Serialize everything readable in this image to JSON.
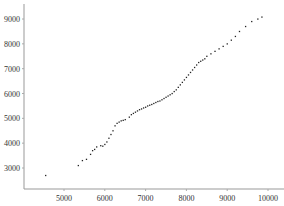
{
  "chart_data": {
    "type": "scatter",
    "title": "",
    "xlabel": "",
    "ylabel": "",
    "xlim": [
      4000,
      10500
    ],
    "ylim": [
      2000,
      9700
    ],
    "xticks": [
      5000,
      6000,
      7000,
      8000,
      9000,
      10000
    ],
    "yticks": [
      3000,
      4000,
      5000,
      6000,
      7000,
      8000,
      9000
    ],
    "grid": false,
    "legend": null,
    "marker_color": "#222222",
    "points": [
      [
        4550,
        2700
      ],
      [
        5350,
        3100
      ],
      [
        5450,
        3300
      ],
      [
        5550,
        3350
      ],
      [
        5650,
        3550
      ],
      [
        5700,
        3700
      ],
      [
        5750,
        3750
      ],
      [
        5800,
        3850
      ],
      [
        5900,
        3900
      ],
      [
        5950,
        3880
      ],
      [
        6000,
        3950
      ],
      [
        6050,
        4050
      ],
      [
        6100,
        4200
      ],
      [
        6150,
        4350
      ],
      [
        6200,
        4500
      ],
      [
        6250,
        4700
      ],
      [
        6300,
        4800
      ],
      [
        6350,
        4850
      ],
      [
        6400,
        4900
      ],
      [
        6450,
        4920
      ],
      [
        6500,
        4950
      ],
      [
        6600,
        5050
      ],
      [
        6650,
        5150
      ],
      [
        6700,
        5200
      ],
      [
        6750,
        5250
      ],
      [
        6800,
        5300
      ],
      [
        6850,
        5350
      ],
      [
        6900,
        5380
      ],
      [
        6950,
        5420
      ],
      [
        7000,
        5450
      ],
      [
        7050,
        5500
      ],
      [
        7100,
        5530
      ],
      [
        7150,
        5560
      ],
      [
        7200,
        5600
      ],
      [
        7250,
        5640
      ],
      [
        7300,
        5680
      ],
      [
        7350,
        5700
      ],
      [
        7400,
        5750
      ],
      [
        7450,
        5800
      ],
      [
        7500,
        5850
      ],
      [
        7550,
        5900
      ],
      [
        7600,
        5950
      ],
      [
        7650,
        6000
      ],
      [
        7700,
        6080
      ],
      [
        7750,
        6150
      ],
      [
        7800,
        6250
      ],
      [
        7850,
        6350
      ],
      [
        7900,
        6450
      ],
      [
        7950,
        6550
      ],
      [
        8000,
        6650
      ],
      [
        8050,
        6750
      ],
      [
        8100,
        6850
      ],
      [
        8150,
        6950
      ],
      [
        8200,
        7050
      ],
      [
        8250,
        7150
      ],
      [
        8300,
        7250
      ],
      [
        8350,
        7300
      ],
      [
        8400,
        7350
      ],
      [
        8450,
        7400
      ],
      [
        8500,
        7500
      ],
      [
        8600,
        7600
      ],
      [
        8700,
        7700
      ],
      [
        8800,
        7800
      ],
      [
        8900,
        7900
      ],
      [
        9000,
        8000
      ],
      [
        9100,
        8150
      ],
      [
        9200,
        8300
      ],
      [
        9300,
        8500
      ],
      [
        9450,
        8700
      ],
      [
        9600,
        8900
      ],
      [
        9750,
        9000
      ],
      [
        9850,
        9080
      ]
    ]
  }
}
